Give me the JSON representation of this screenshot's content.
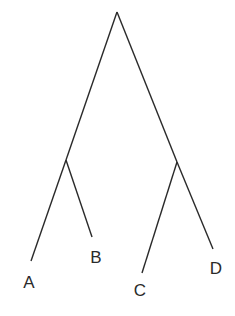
{
  "diagram": {
    "type": "tree",
    "line_color": "#2a2a2a",
    "nodes": {
      "root": {
        "x": 117,
        "y": 12
      },
      "left": {
        "x": 66,
        "y": 160
      },
      "right": {
        "x": 177,
        "y": 162
      }
    },
    "leaves": [
      {
        "label": "A",
        "end": {
          "x": 31,
          "y": 261
        },
        "label_pos": {
          "x": 29,
          "y": 282
        }
      },
      {
        "label": "B",
        "end": {
          "x": 92,
          "y": 237
        },
        "label_pos": {
          "x": 96,
          "y": 257
        }
      },
      {
        "label": "C",
        "end": {
          "x": 142,
          "y": 273
        },
        "label_pos": {
          "x": 140,
          "y": 290
        }
      },
      {
        "label": "D",
        "end": {
          "x": 213,
          "y": 249
        },
        "label_pos": {
          "x": 216,
          "y": 268
        }
      }
    ]
  }
}
